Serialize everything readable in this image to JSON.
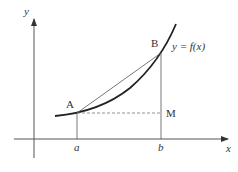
{
  "diagram": {
    "type": "secant-line-on-curve",
    "axes": {
      "x_label": "x",
      "y_label": "y"
    },
    "curve": {
      "label": "y = f(x)"
    },
    "points": {
      "A": {
        "label": "A"
      },
      "B": {
        "label": "B"
      },
      "M": {
        "label": "M"
      }
    },
    "ticks": {
      "a": "a",
      "b": "b"
    },
    "colors": {
      "axis": "#555555",
      "curve": "#222222",
      "line": "#555555",
      "dashed": "#777777",
      "text": "#333333"
    }
  }
}
